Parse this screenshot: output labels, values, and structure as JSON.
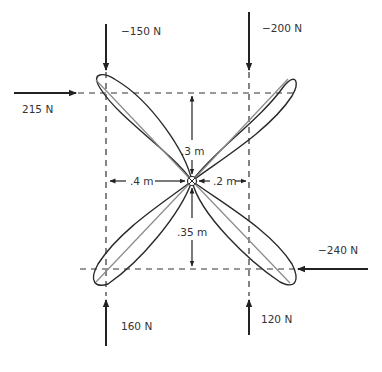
{
  "diagram": {
    "type": "force-diagram",
    "center": {
      "symbol": "circle-with-x",
      "name": "pivot"
    },
    "forces": [
      {
        "id": "f1",
        "label": "−150 N",
        "direction": "down",
        "location": "top-left"
      },
      {
        "id": "f2",
        "label": "−200 N",
        "direction": "down",
        "location": "top-right"
      },
      {
        "id": "f3",
        "label": "215 N",
        "direction": "right",
        "location": "top-left"
      },
      {
        "id": "f4",
        "label": "−240 N",
        "direction": "left",
        "location": "bottom-right"
      },
      {
        "id": "f5",
        "label": "160 N",
        "direction": "up",
        "location": "bottom-left"
      },
      {
        "id": "f6",
        "label": "120 N",
        "direction": "up",
        "location": "bottom-right"
      }
    ],
    "dimensions": [
      {
        "id": "d_up",
        "label": ".3 m",
        "direction": "vertical-up"
      },
      {
        "id": "d_down",
        "label": ".35 m",
        "direction": "vertical-down"
      },
      {
        "id": "d_left",
        "label": ".4 m",
        "direction": "horizontal-left"
      },
      {
        "id": "d_right",
        "label": ".2 m",
        "direction": "horizontal-right"
      }
    ],
    "colors": {
      "outline": "#2a2a2a",
      "axis_line": "#8a8a8a",
      "dashed": "#333333",
      "text": "#333333"
    }
  }
}
